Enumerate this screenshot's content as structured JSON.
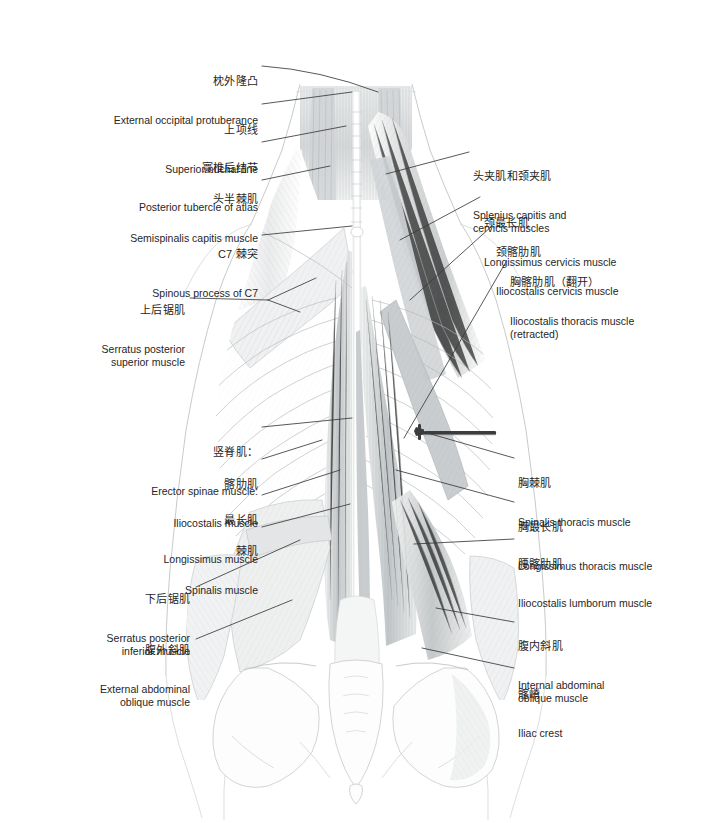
{
  "figure": {
    "view": "posterior",
    "background_color": "#ffffff",
    "leader_line_color": "#3a3a3a",
    "text_color": "#262626",
    "instrument": {
      "name": "retractor-probe",
      "color": "#3c3c3c",
      "note": "dark horizontal retractor holding iliocostalis thoracis open"
    }
  },
  "labels_left": [
    {
      "id": "external-occipital-protuberance",
      "cn": "枕外隆凸",
      "en": "External occipital protuberance",
      "x": 258,
      "y": 48,
      "align": "right"
    },
    {
      "id": "superior-nuchal-line",
      "cn": "上项线",
      "en": "Superior nuchal line",
      "x": 258,
      "y": 97,
      "align": "right"
    },
    {
      "id": "posterior-tubercle-of-atlas",
      "cn": "寰椎后结节",
      "en": "Posterior tubercle of atlas",
      "x": 258,
      "y": 135,
      "align": "right"
    },
    {
      "id": "semispinalis-capitis-muscle",
      "cn": "头半棘肌",
      "en": "Semispinalis capitis muscle",
      "x": 258,
      "y": 166,
      "align": "right"
    },
    {
      "id": "spinous-process-of-c7",
      "cn": "C7 棘突",
      "en": "Spinous process of C7",
      "x": 258,
      "y": 221,
      "align": "right"
    },
    {
      "id": "serratus-posterior-superior-muscle",
      "cn": "上后锯肌",
      "en": "Serratus posterior\nsuperior muscle",
      "x": 185,
      "y": 277,
      "align": "right"
    },
    {
      "id": "erector-spinae-muscle",
      "cn": "竖脊肌：",
      "en": "Erector spinae muscle:",
      "x": 258,
      "y": 419,
      "align": "right"
    },
    {
      "id": "iliocostalis-muscle",
      "cn": "髂肋肌",
      "en": "Iliocostalis muscle",
      "x": 258,
      "y": 451,
      "align": "right"
    },
    {
      "id": "longissimus-muscle",
      "cn": "最长肌",
      "en": "Longissimus muscle",
      "x": 258,
      "y": 487,
      "align": "right"
    },
    {
      "id": "spinalis-muscle",
      "cn": "棘肌",
      "en": "Spinalis muscle",
      "x": 258,
      "y": 518,
      "align": "right"
    },
    {
      "id": "serratus-posterior-inferior-muscle",
      "cn": "下后锯肌",
      "en": "Serratus posterior\ninferior muscle",
      "x": 190,
      "y": 566,
      "align": "right"
    },
    {
      "id": "external-abdominal-oblique-muscle",
      "cn": "腹外斜肌",
      "en": "External abdominal\noblique muscle",
      "x": 190,
      "y": 617,
      "align": "right"
    }
  ],
  "labels_right": [
    {
      "id": "splenius-capitis-and-cervicis-muscles",
      "cn": "头夹肌和颈夹肌",
      "en": "Splenius capitis and\ncervicis muscles",
      "x": 473,
      "y": 143,
      "align": "left"
    },
    {
      "id": "longissimus-cervicis-muscle",
      "cn": "颈最长肌",
      "en": "Longissimus cervicis muscle",
      "x": 484,
      "y": 190,
      "align": "left"
    },
    {
      "id": "iliocostalis-cervicis-muscle",
      "cn": "颈髂肋肌",
      "en": "Iliocostalis cervicis muscle",
      "x": 496,
      "y": 219,
      "align": "left"
    },
    {
      "id": "iliocostalis-thoracis-muscle-retracted",
      "cn": "胸髂肋肌（翻开）",
      "en": "Iliocostalis thoracis muscle\n(retracted)",
      "x": 510,
      "y": 249,
      "align": "left"
    },
    {
      "id": "spinalis-thoracis-muscle",
      "cn": "胸棘肌",
      "en": "Spinalis thoracis muscle",
      "x": 518,
      "y": 450,
      "align": "left"
    },
    {
      "id": "longissimus-thoracis-muscle",
      "cn": "胸最长肌",
      "en": "Longissimus thoracis muscle",
      "x": 518,
      "y": 494,
      "align": "left"
    },
    {
      "id": "iliocostalis-lumborum-muscle",
      "cn": "腰髂肋肌",
      "en": "Iliocostalis lumborum muscle",
      "x": 518,
      "y": 531,
      "align": "left"
    },
    {
      "id": "internal-abdominal-oblique-muscle",
      "cn": "腹内斜肌",
      "en": "Internal abdominal\noblique muscle",
      "x": 518,
      "y": 613,
      "align": "left"
    },
    {
      "id": "iliac-crest",
      "cn": "髂嵴",
      "en": "Iliac crest",
      "x": 518,
      "y": 661,
      "align": "left"
    }
  ]
}
